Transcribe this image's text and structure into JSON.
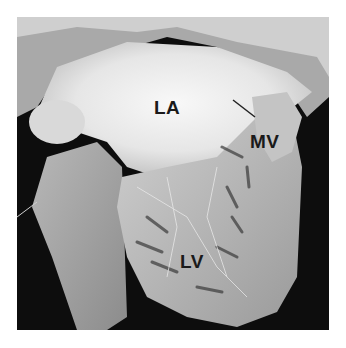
{
  "image": {
    "description": "Anatomical specimen photograph of an opened heart showing left atrium, mitral valve and left ventricle",
    "labels": [
      {
        "id": "la",
        "text": "LA"
      },
      {
        "id": "mv",
        "text": "MV"
      },
      {
        "id": "lv",
        "text": "LV"
      }
    ]
  }
}
